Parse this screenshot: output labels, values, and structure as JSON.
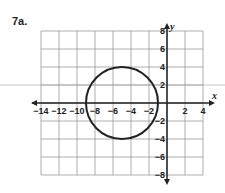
{
  "problem": {
    "label": "7a."
  },
  "chart_data": {
    "type": "scatter",
    "title": "",
    "xlabel": "x",
    "ylabel": "y",
    "xlim": [
      -14,
      4
    ],
    "ylim": [
      -8,
      8
    ],
    "grid": true,
    "grid_step": 2,
    "x_ticks": [
      "-14",
      "-12",
      "-10",
      "-8",
      "-6",
      "-4",
      "-2",
      "2",
      "4"
    ],
    "y_ticks": [
      "8",
      "6",
      "4",
      "2",
      "-2",
      "-4",
      "-6",
      "-8"
    ],
    "shapes": [
      {
        "shape": "circle",
        "center": [
          -5,
          0
        ],
        "radius": 4
      }
    ]
  },
  "colors": {
    "ink": "#222222",
    "grid": "#9a9a9a",
    "guide": "#c8c8c8"
  }
}
